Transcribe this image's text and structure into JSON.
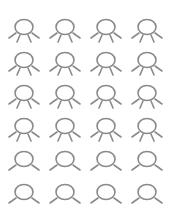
{
  "grid": {
    "stroke_color": "#8a8a8a",
    "rows": [
      {
        "variant": "four-legs",
        "count": 4
      },
      {
        "variant": "four-legs",
        "count": 4
      },
      {
        "variant": "four-legs",
        "count": 4
      },
      {
        "variant": "four-legs",
        "count": 4
      },
      {
        "variant": "two-legs",
        "count": 4
      },
      {
        "variant": "two-legs",
        "count": 4
      }
    ]
  },
  "caption": ""
}
